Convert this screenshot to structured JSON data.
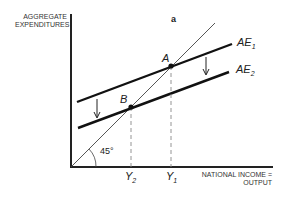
{
  "panel_label": "a",
  "y_axis_label_line1": "AGGREGATE",
  "y_axis_label_line2": "EXPENDITURES",
  "x_axis_label_line1": "NATIONAL INCOME =",
  "x_axis_label_line2": "OUTPUT",
  "angle_label": "45°",
  "curves": {
    "ae1": {
      "name": "AE",
      "sub": "1"
    },
    "ae2": {
      "name": "AE",
      "sub": "2"
    }
  },
  "points": {
    "a": "A",
    "b": "B"
  },
  "ticks": {
    "y2": {
      "name": "Y",
      "sub": "2"
    },
    "y1": {
      "name": "Y",
      "sub": "1"
    }
  }
}
